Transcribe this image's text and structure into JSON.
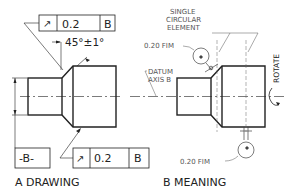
{
  "left_view": {
    "caption": "A DRAWING",
    "fcf_top": {
      "symbol": "circular-runout-arrow",
      "symbol_glyph": "↗",
      "tolerance": "0.2",
      "datum": "B"
    },
    "angle_note": "45°±1°",
    "datum_feature": "-B-",
    "fcf_bottom": {
      "symbol": "circular-runout-arrow",
      "symbol_glyph": "↗",
      "tolerance": "0.2",
      "datum": "B"
    }
  },
  "right_view": {
    "caption": "B MEANING",
    "label_single": "SINGLE",
    "label_circular": "CIRCULAR",
    "label_element": "ELEMENT",
    "fim_top": "0.20 FIM",
    "fim_bottom": "0.20 FIM",
    "datum_line1": "DATUM",
    "datum_line2": "AXIS B",
    "rotate_label": "ROTATE"
  }
}
